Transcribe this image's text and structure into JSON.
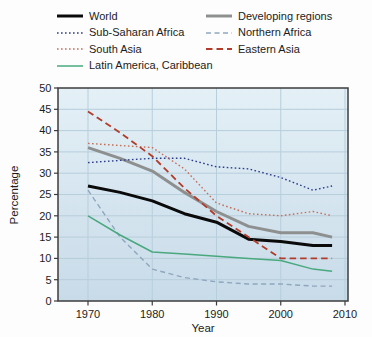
{
  "figure": {
    "background": "#fdfdfd",
    "plot_bg_top": "#e4f0f6",
    "plot_bg_bottom": "#c8dbe9",
    "gridline_color": "#b7cedb",
    "border_color": "#3c3c3c",
    "text_color": "#1c1c1c"
  },
  "chart_data": {
    "type": "line",
    "title": "",
    "xlabel": "Year",
    "ylabel": "Percentage",
    "xlim": [
      1965.3,
      2010.5
    ],
    "ylim": [
      0,
      50
    ],
    "xticks": [
      1970,
      1980,
      1990,
      2000,
      2010
    ],
    "yticks": [
      0,
      5,
      10,
      15,
      20,
      25,
      30,
      35,
      40,
      45,
      50
    ],
    "grid": true,
    "legend_position": "top",
    "x": [
      1970,
      1975,
      1980,
      1985,
      1990,
      1995,
      2000,
      2005,
      2008
    ],
    "series": [
      {
        "name": "World",
        "color": "#0a0a0a",
        "width": 3,
        "dasharray": "",
        "values": [
          27,
          25.5,
          23.5,
          20.5,
          18.5,
          14.5,
          14,
          13,
          13
        ]
      },
      {
        "name": "Developing regions",
        "color": "#8e9090",
        "width": 3,
        "dasharray": "",
        "values": [
          36,
          33.5,
          30.5,
          25.5,
          21,
          17.5,
          16,
          16,
          15
        ]
      },
      {
        "name": "Sub-Saharan Africa",
        "color": "#2c3c8c",
        "width": 1.4,
        "dasharray": "1.6,2.4",
        "values": [
          32.5,
          33,
          33.5,
          33.5,
          31.5,
          31,
          29,
          26,
          27
        ]
      },
      {
        "name": "Northern Africa",
        "color": "#8fa6bf",
        "width": 1.4,
        "dasharray": "5,3.5",
        "values": [
          26,
          15,
          7.5,
          5.5,
          4.5,
          4,
          4,
          3.5,
          3.5
        ]
      },
      {
        "name": "South Asia",
        "color": "#c4705a",
        "width": 1.4,
        "dasharray": "1.6,2.4",
        "values": [
          37,
          36.5,
          36,
          31,
          23,
          20.5,
          20,
          21,
          20
        ]
      },
      {
        "name": "Eastern Asia",
        "color": "#b13c2b",
        "width": 1.8,
        "dasharray": "6.5,4",
        "values": [
          44.5,
          39.5,
          34,
          26.5,
          20,
          15,
          10,
          10,
          10
        ]
      },
      {
        "name": "Latin America, Caribbean",
        "color": "#4aa87e",
        "width": 1.5,
        "dasharray": "",
        "values": [
          20,
          15.5,
          11.5,
          11,
          10.5,
          10,
          9.5,
          7.5,
          7
        ]
      }
    ],
    "legend_columns": [
      [
        0,
        2,
        4,
        6
      ],
      [
        1,
        3,
        5
      ]
    ]
  }
}
